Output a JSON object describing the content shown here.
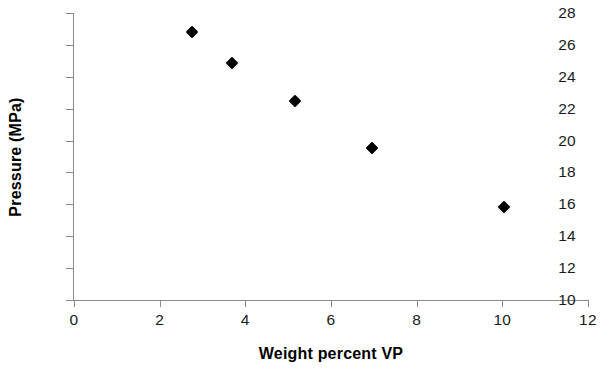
{
  "chart_data": {
    "type": "scatter",
    "title": "",
    "xlabel": "Weight percent VP",
    "ylabel": "Pressure (MPa)",
    "xlim": [
      0,
      12
    ],
    "ylim": [
      10,
      28
    ],
    "xticks": [
      "0",
      "2",
      "4",
      "6",
      "8",
      "10",
      "12"
    ],
    "yticks": [
      "10",
      "12",
      "14",
      "16",
      "18",
      "20",
      "22",
      "24",
      "26",
      "28"
    ],
    "xtick_values": [
      0,
      2,
      4,
      6,
      8,
      10,
      12
    ],
    "ytick_values": [
      10,
      12,
      14,
      16,
      18,
      20,
      22,
      24,
      26,
      28
    ],
    "grid": false,
    "legend": false,
    "marker_shape": "diamond",
    "marker_color": "#000000",
    "axis_color": "#8a8a8a",
    "series": [
      {
        "name": "Pressure vs weight percent VP",
        "x": [
          2.75,
          3.7,
          5.15,
          6.95,
          10.05
        ],
        "y": [
          26.8,
          24.85,
          22.5,
          19.55,
          15.85
        ]
      }
    ],
    "points": [
      {
        "x": 2.75,
        "y": 26.8
      },
      {
        "x": 3.7,
        "y": 24.85
      },
      {
        "x": 5.15,
        "y": 22.5
      },
      {
        "x": 6.95,
        "y": 19.55
      },
      {
        "x": 10.05,
        "y": 15.85
      }
    ]
  }
}
